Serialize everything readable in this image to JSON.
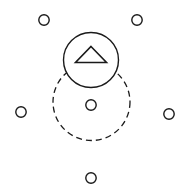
{
  "canvas": {
    "width": 187,
    "height": 195,
    "background": "#ffffff",
    "stroke_color": "#1a1a1a",
    "title": "Radial node diagram with selected marker"
  },
  "style": {
    "node_stroke_width": 1.4,
    "ring_stroke_width": 1.3,
    "marker_stroke_width": 1.4,
    "triangle_stroke_width": 1.6,
    "dash_pattern": "6 4"
  },
  "selection_ring": {
    "label": "dashed-selection-ring",
    "cx": 91.5,
    "cy": 102,
    "r": 38.5,
    "dashed": true,
    "stroke": "#1a1a1a"
  },
  "marker": {
    "label": "up-arrow-marker",
    "cx": 91,
    "cy": 60,
    "r": 27.5,
    "stroke": "#1a1a1a",
    "fill": "#ffffff",
    "glyph": "triangle-up-icon",
    "triangle": {
      "apex_x": 91,
      "apex_y": 46.5,
      "left_x": 75.5,
      "left_y": 62.5,
      "right_x": 106.5,
      "right_y": 62.5
    }
  },
  "nodes": [
    {
      "id": "node-top-left",
      "label": "top-left-node",
      "cx": 44,
      "cy": 20,
      "r": 5.2
    },
    {
      "id": "node-top-right",
      "label": "top-right-node",
      "cx": 137,
      "cy": 20,
      "r": 5.2
    },
    {
      "id": "node-left",
      "label": "left-node",
      "cx": 21,
      "cy": 112,
      "r": 5.2
    },
    {
      "id": "node-center",
      "label": "center-node",
      "cx": 91,
      "cy": 105,
      "r": 5.2
    },
    {
      "id": "node-right",
      "label": "right-node",
      "cx": 169,
      "cy": 114,
      "r": 5.2
    },
    {
      "id": "node-bottom",
      "label": "bottom-node",
      "cx": 91,
      "cy": 178,
      "r": 5.2
    }
  ]
}
